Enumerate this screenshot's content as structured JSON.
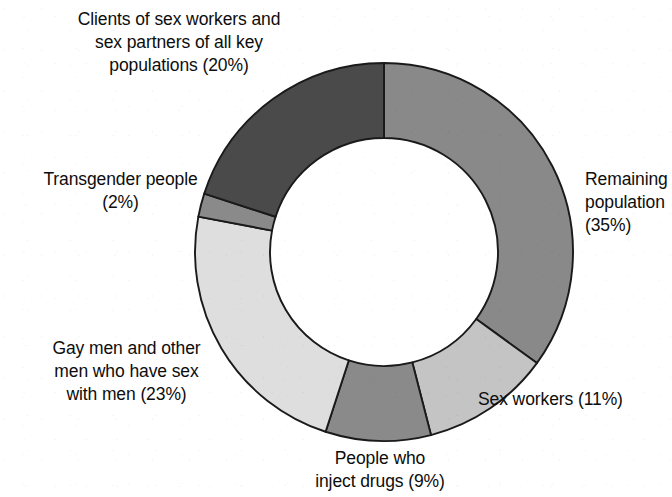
{
  "chart_data": {
    "type": "pie",
    "variant": "donut",
    "title": "",
    "subtitle": "",
    "xlabel": "",
    "ylabel": "",
    "units": "percent",
    "start_angle_deg": 0,
    "direction": "clockwise",
    "inner_radius_ratio": 0.6,
    "legend_position": "none",
    "labels_placement": "outside-callout-free",
    "grid": false,
    "categories": [
      "Remaining population",
      "Sex workers",
      "People who inject drugs",
      "Gay men and other men who have sex with men",
      "Transgender people",
      "Clients of sex workers and sex partners of all key populations"
    ],
    "values": [
      35,
      11,
      9,
      23,
      2,
      20
    ],
    "colors": [
      "#898989",
      "#c4c4c4",
      "#8a8a8a",
      "#dedede",
      "#8a8a8a",
      "#4a4a4a"
    ],
    "slices": [
      {
        "name": "Remaining population",
        "value": 35,
        "value_text": "35%",
        "label_text": "Remaining\npopulation\n(35%)",
        "color": "#898989"
      },
      {
        "name": "Sex workers",
        "value": 11,
        "value_text": "11%",
        "label_text": "Sex workers (11%)",
        "color": "#c4c4c4"
      },
      {
        "name": "People who inject drugs",
        "value": 9,
        "value_text": "9%",
        "label_text": "People who\ninject drugs (9%)",
        "color": "#8a8a8a"
      },
      {
        "name": "Gay men and other men who have sex with men",
        "value": 23,
        "value_text": "23%",
        "label_text": "Gay men and other\nmen who have sex\nwith men (23%)",
        "color": "#dedede"
      },
      {
        "name": "Transgender people",
        "value": 2,
        "value_text": "2%",
        "label_text": "Transgender people\n(2%)",
        "color": "#8a8a8a"
      },
      {
        "name": "Clients of sex workers and sex partners of all key populations",
        "value": 20,
        "value_text": "20%",
        "label_text": "Clients of sex workers and\nsex partners of all key\npopulations (20%)",
        "color": "#4a4a4a"
      }
    ],
    "stroke_color": "#1a1a1a",
    "background": "#ffffff"
  }
}
